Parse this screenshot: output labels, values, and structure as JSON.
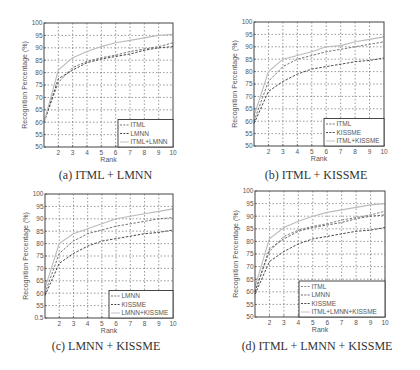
{
  "chart_data": [
    {
      "type": "line",
      "id": "a",
      "caption": "(a) ITML + LMNN",
      "xlabel": "Rank",
      "ylabel": "Recognition Percentage (%)",
      "xlim": [
        1,
        10
      ],
      "ylim": [
        50,
        100
      ],
      "xticks": [
        "2",
        "3",
        "4",
        "5",
        "6",
        "7",
        "8",
        "9",
        "10"
      ],
      "yticks": [
        "50",
        "55",
        "60",
        "65",
        "70",
        "75",
        "80",
        "85",
        "90",
        "95",
        "100"
      ],
      "grid": true,
      "legend_position": "bottom-right",
      "x": [
        1,
        2,
        3,
        4,
        5,
        6,
        7,
        8,
        9,
        10
      ],
      "series": [
        {
          "name": "ITML",
          "style": "dashed",
          "color": "#666666",
          "values": [
            60,
            76,
            82,
            84.5,
            86,
            87,
            88.5,
            89.5,
            90.5,
            92
          ]
        },
        {
          "name": "LMNN",
          "style": "dashed",
          "color": "#333333",
          "values": [
            60,
            77.5,
            81,
            84,
            85.5,
            86.5,
            87.5,
            89,
            90,
            90.5
          ]
        },
        {
          "name": "ITML+LMNN",
          "style": "solid",
          "color": "#bbbbbb",
          "values": [
            60,
            81,
            86,
            88.5,
            90.5,
            92,
            93,
            94,
            95,
            95.5
          ]
        }
      ]
    },
    {
      "type": "line",
      "id": "b",
      "caption": "(b) ITML + KISSME",
      "xlabel": "Rank",
      "ylabel": "Recognition Percentage (%)",
      "xlim": [
        1,
        10
      ],
      "ylim": [
        50,
        100
      ],
      "xticks": [
        "2",
        "3",
        "4",
        "5",
        "6",
        "7",
        "8",
        "9",
        "10"
      ],
      "yticks": [
        "50",
        "55",
        "60",
        "65",
        "70",
        "75",
        "80",
        "85",
        "90",
        "95",
        "100"
      ],
      "grid": true,
      "legend_position": "bottom-right",
      "x": [
        1,
        2,
        3,
        4,
        5,
        6,
        7,
        8,
        9,
        10
      ],
      "series": [
        {
          "name": "ITML",
          "style": "dashed",
          "color": "#666666",
          "values": [
            60,
            76,
            82,
            85,
            86.5,
            88,
            89,
            90,
            91,
            92
          ]
        },
        {
          "name": "KISSME",
          "style": "dashed",
          "color": "#333333",
          "values": [
            59,
            72,
            76,
            79,
            81,
            82,
            83,
            84,
            84.5,
            85.5
          ]
        },
        {
          "name": "ITML+KISSME",
          "style": "solid",
          "color": "#bbbbbb",
          "values": [
            62,
            80,
            85,
            86.5,
            88,
            90,
            90.5,
            92,
            93,
            94
          ]
        }
      ]
    },
    {
      "type": "line",
      "id": "c",
      "caption": "(c) LMNN + KISSME",
      "xlabel": "Rank",
      "ylabel": "Recognition Percentage (%)",
      "xlim": [
        1,
        10
      ],
      "ylim": [
        50,
        100
      ],
      "xticks": [
        "2",
        "3",
        "4",
        "5",
        "6",
        "7",
        "8",
        "9",
        "10"
      ],
      "yticks": [
        "0.5",
        "55",
        "60",
        "65",
        "70",
        "75",
        "80",
        "85",
        "90",
        "95",
        "100"
      ],
      "grid": true,
      "legend_position": "bottom-right",
      "x": [
        1,
        2,
        3,
        4,
        5,
        6,
        7,
        8,
        9,
        10
      ],
      "series": [
        {
          "name": "LMNN",
          "style": "dashed",
          "color": "#666666",
          "values": [
            60,
            76,
            81,
            84,
            85.5,
            87,
            88,
            89,
            90,
            90.5
          ]
        },
        {
          "name": "KISSME",
          "style": "dashed",
          "color": "#333333",
          "values": [
            59,
            72,
            76,
            79,
            81,
            82,
            83,
            84,
            84.5,
            85.5
          ]
        },
        {
          "name": "LMNN+KISSME",
          "style": "solid",
          "color": "#bbbbbb",
          "values": [
            62,
            80,
            84,
            86,
            88,
            90,
            91,
            92,
            93,
            94
          ]
        }
      ]
    },
    {
      "type": "line",
      "id": "d",
      "caption": "(d) ITML + LMNN + KISSME",
      "xlabel": "Rank",
      "ylabel": "Recognition Percentage (%)",
      "xlim": [
        1,
        10
      ],
      "ylim": [
        50,
        100
      ],
      "xticks": [
        "2",
        "3",
        "4",
        "5",
        "6",
        "7",
        "8",
        "9",
        "10"
      ],
      "yticks": [
        "50",
        "55",
        "60",
        "65",
        "70",
        "75",
        "80",
        "85",
        "90",
        "95",
        "100"
      ],
      "grid": true,
      "legend_position": "bottom-right",
      "x": [
        1,
        2,
        3,
        4,
        5,
        6,
        7,
        8,
        9,
        10
      ],
      "series": [
        {
          "name": "ITML",
          "style": "dashed",
          "color": "#777777",
          "values": [
            60,
            76,
            82,
            84.5,
            86,
            87,
            88.5,
            89.5,
            90.5,
            92
          ]
        },
        {
          "name": "LMNN",
          "style": "dashed",
          "color": "#555555",
          "values": [
            60,
            77,
            81,
            84,
            85.5,
            86.5,
            87.5,
            89,
            90,
            90.5
          ]
        },
        {
          "name": "KISSME",
          "style": "dashed",
          "color": "#333333",
          "values": [
            59,
            72,
            76,
            79,
            81,
            82,
            83,
            84,
            84.5,
            85.5
          ]
        },
        {
          "name": "ITML+LMNN+KISSME",
          "style": "solid",
          "color": "#bbbbbb",
          "values": [
            62,
            81,
            85.5,
            88,
            90,
            91.5,
            92.5,
            93.5,
            94.5,
            95
          ]
        }
      ]
    }
  ]
}
